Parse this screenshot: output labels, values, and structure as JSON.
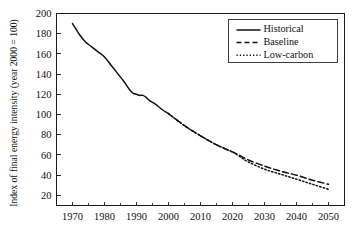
{
  "chart_data": {
    "type": "line",
    "title": "",
    "xlabel": "",
    "ylabel": "Index of final energy intensity (year 2000 = 100)",
    "xlim": [
      1965,
      2055
    ],
    "ylim": [
      10,
      200
    ],
    "grid": false,
    "legend_position": "top-right",
    "xticks": [
      "1970",
      "1980",
      "1990",
      "2000",
      "2010",
      "2020",
      "2030",
      "2040",
      "2050"
    ],
    "xtick_values": [
      1970,
      1980,
      1990,
      2000,
      2010,
      2020,
      2030,
      2040,
      2050
    ],
    "yticks": [
      "20",
      "40",
      "60",
      "80",
      "100",
      "120",
      "140",
      "160",
      "180",
      "200"
    ],
    "ytick_values": [
      20,
      40,
      60,
      80,
      100,
      120,
      140,
      160,
      180,
      200
    ],
    "series": [
      {
        "name": "Historical",
        "style": "solid",
        "color": "#111111",
        "x": [
          1970,
          1972,
          1974,
          1976,
          1978,
          1980,
          1982,
          1984,
          1986,
          1988,
          1989,
          1990,
          1991,
          1992,
          1993,
          1994,
          1996,
          1998,
          2000
        ],
        "values": [
          190,
          180,
          172,
          167,
          162,
          157,
          149,
          141,
          133,
          124,
          121,
          120,
          119,
          119,
          117,
          114,
          110,
          105,
          101
        ]
      },
      {
        "name": "Baseline",
        "style": "dashed",
        "color": "#111111",
        "x": [
          2000,
          2005,
          2010,
          2015,
          2020,
          2022,
          2025,
          2030,
          2035,
          2040,
          2045,
          2050
        ],
        "values": [
          101,
          89,
          79,
          70,
          63,
          60,
          55,
          49,
          44,
          40,
          35,
          31
        ]
      },
      {
        "name": "Low-carbon",
        "style": "dotted",
        "color": "#111111",
        "x": [
          2000,
          2005,
          2010,
          2015,
          2020,
          2022,
          2025,
          2030,
          2035,
          2040,
          2045,
          2050
        ],
        "values": [
          101,
          89,
          79,
          70,
          63,
          59,
          53,
          46,
          41,
          36,
          31,
          26
        ]
      }
    ],
    "annotations": []
  },
  "legend": {
    "items": [
      {
        "label": "Historical",
        "style": "solid"
      },
      {
        "label": "Baseline",
        "style": "dashed"
      },
      {
        "label": "Low-carbon",
        "style": "dotted"
      }
    ]
  },
  "axes": {
    "y_title": "Index of final energy intensity (year 2000 = 100)"
  }
}
